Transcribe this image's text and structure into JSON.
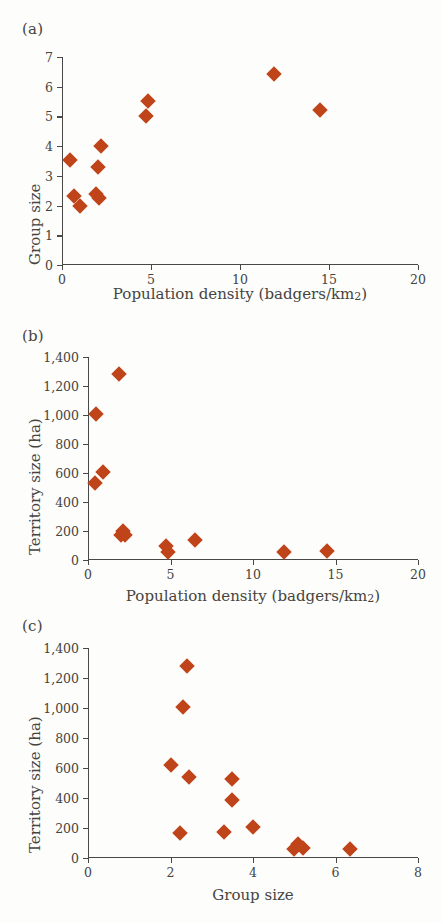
{
  "figure": {
    "marker_color": "#c0441a",
    "axis_color": "#4a4846",
    "background": "#fdfdfb",
    "text_color": "#46443f"
  },
  "panels": {
    "a": {
      "tag": "(a)"
    },
    "b": {
      "tag": "(b)"
    },
    "c": {
      "tag": "(c)"
    }
  },
  "labels": {
    "population_density": "Population density (badgers/km",
    "population_density_sup": "2",
    "population_density_close": ")",
    "group_size": "Group size",
    "territory_size": "Territory size (ha)"
  },
  "chart_data": [
    {
      "id": "a",
      "type": "scatter",
      "title": "(a)",
      "xlabel": "Population density (badgers/km2)",
      "ylabel": "Group size",
      "xlim": [
        0,
        20
      ],
      "ylim": [
        0,
        7
      ],
      "xticks": [
        0,
        5,
        10,
        15,
        20
      ],
      "xticklabels": [
        "0",
        "5",
        "10",
        "15",
        "20"
      ],
      "yticks": [
        0,
        1,
        2,
        3,
        4,
        5,
        6,
        7
      ],
      "yticklabels": [
        "0",
        "1",
        "2",
        "3",
        "4",
        "5",
        "6",
        "7"
      ],
      "grid": false,
      "legend": null,
      "points": [
        {
          "x": 0.45,
          "y": 3.52
        },
        {
          "x": 0.7,
          "y": 2.32
        },
        {
          "x": 1.0,
          "y": 2.0
        },
        {
          "x": 1.9,
          "y": 2.4
        },
        {
          "x": 2.1,
          "y": 2.25
        },
        {
          "x": 2.0,
          "y": 3.3
        },
        {
          "x": 2.2,
          "y": 4.02
        },
        {
          "x": 4.7,
          "y": 5.02
        },
        {
          "x": 4.85,
          "y": 5.52
        },
        {
          "x": 11.9,
          "y": 6.42
        },
        {
          "x": 14.5,
          "y": 5.2
        }
      ]
    },
    {
      "id": "b",
      "type": "scatter",
      "title": "(b)",
      "xlabel": "Population density (badgers/km2)",
      "ylabel": "Territory size (ha)",
      "xlim": [
        0,
        20
      ],
      "ylim": [
        0,
        1400
      ],
      "xticks": [
        0,
        5,
        10,
        15,
        20
      ],
      "xticklabels": [
        "0",
        "5",
        "10",
        "15",
        "20"
      ],
      "yticks": [
        0,
        200,
        400,
        600,
        800,
        1000,
        1200,
        1400
      ],
      "yticklabels": [
        "0",
        "200",
        "400",
        "600",
        "800",
        "1,000",
        "1,200",
        "1,400"
      ],
      "grid": false,
      "legend": null,
      "points": [
        {
          "x": 0.5,
          "y": 1005
        },
        {
          "x": 1.85,
          "y": 1280
        },
        {
          "x": 0.9,
          "y": 610
        },
        {
          "x": 0.45,
          "y": 530
        },
        {
          "x": 2.0,
          "y": 170
        },
        {
          "x": 2.15,
          "y": 200
        },
        {
          "x": 2.25,
          "y": 175
        },
        {
          "x": 4.75,
          "y": 95
        },
        {
          "x": 4.85,
          "y": 55
        },
        {
          "x": 6.5,
          "y": 140
        },
        {
          "x": 11.9,
          "y": 55
        },
        {
          "x": 14.5,
          "y": 65
        }
      ]
    },
    {
      "id": "c",
      "type": "scatter",
      "title": "(c)",
      "xlabel": "Group size",
      "ylabel": "Territory size (ha)",
      "xlim": [
        0,
        8
      ],
      "ylim": [
        0,
        1400
      ],
      "xticks": [
        0,
        2,
        4,
        6,
        8
      ],
      "xticklabels": [
        "0",
        "2",
        "4",
        "6",
        "8"
      ],
      "yticks": [
        0,
        200,
        400,
        600,
        800,
        1000,
        1200,
        1400
      ],
      "yticklabels": [
        "0",
        "200",
        "400",
        "600",
        "800",
        "1,000",
        "1,200",
        "1,400"
      ],
      "grid": false,
      "legend": null,
      "points": [
        {
          "x": 2.4,
          "y": 1280
        },
        {
          "x": 2.3,
          "y": 1005
        },
        {
          "x": 2.02,
          "y": 620
        },
        {
          "x": 2.45,
          "y": 540
        },
        {
          "x": 3.5,
          "y": 530
        },
        {
          "x": 3.5,
          "y": 385
        },
        {
          "x": 2.22,
          "y": 168
        },
        {
          "x": 3.3,
          "y": 175
        },
        {
          "x": 4.0,
          "y": 210
        },
        {
          "x": 5.0,
          "y": 58
        },
        {
          "x": 5.1,
          "y": 95
        },
        {
          "x": 5.2,
          "y": 65
        },
        {
          "x": 6.35,
          "y": 58
        }
      ]
    }
  ]
}
